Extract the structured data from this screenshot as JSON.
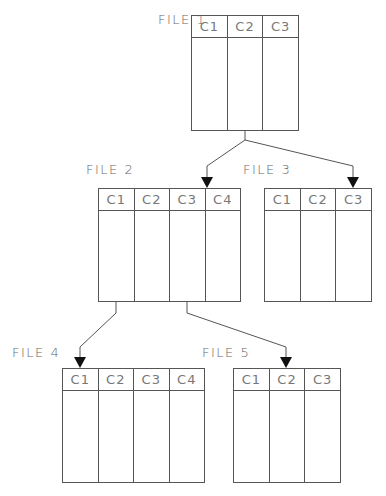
{
  "diagram": {
    "files": [
      {
        "id": "file1",
        "label": "FILE 1",
        "columns": [
          "C1",
          "C2",
          "C3"
        ]
      },
      {
        "id": "file2",
        "label": "FILE 2",
        "columns": [
          "C1",
          "C2",
          "C3",
          "C4"
        ]
      },
      {
        "id": "file3",
        "label": "FILE 3",
        "columns": [
          "C1",
          "C2",
          "C3"
        ]
      },
      {
        "id": "file4",
        "label": "FILE 4",
        "columns": [
          "C1",
          "C2",
          "C3",
          "C4"
        ]
      },
      {
        "id": "file5",
        "label": "FILE 5",
        "columns": [
          "C1",
          "C2",
          "C3"
        ]
      }
    ],
    "connections": [
      {
        "from": "FILE 1",
        "to": "FILE 2",
        "target_column": "C4"
      },
      {
        "from": "FILE 1",
        "to": "FILE 3",
        "target_column": "C3"
      },
      {
        "from": "FILE 2",
        "to": "FILE 4",
        "target_column": "C1"
      },
      {
        "from": "FILE 2",
        "to": "FILE 5",
        "target_column": "C2"
      }
    ],
    "colors": {
      "line": "#555555",
      "text": "#666666",
      "background": "#ffffff"
    }
  }
}
